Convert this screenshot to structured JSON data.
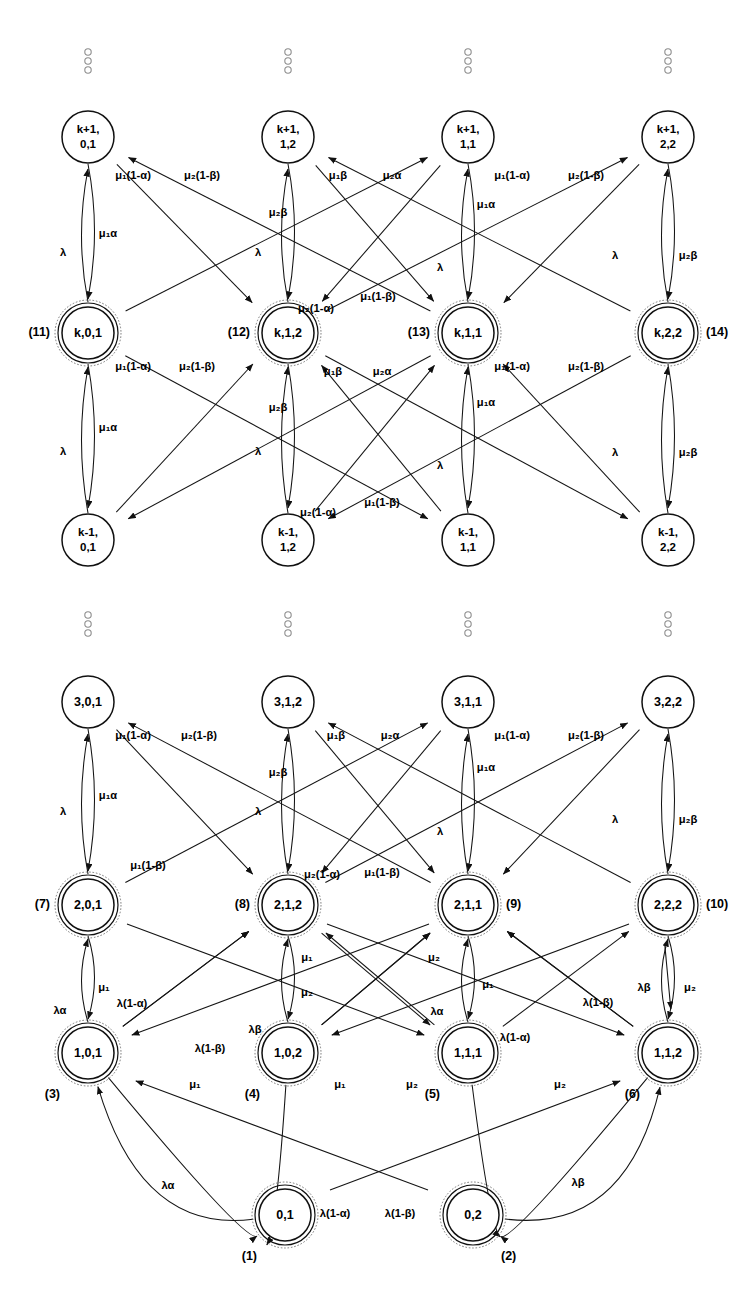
{
  "figure": {
    "type": "state-transition-diagram",
    "symbols": {
      "lambda": "λ",
      "mu": "μ",
      "alpha": "α",
      "beta": "β"
    }
  },
  "columns": [
    {
      "key": "c1",
      "x": 88,
      "tail": "0,1"
    },
    {
      "key": "c2",
      "x": 288,
      "tail": "1,2"
    },
    {
      "key": "c3",
      "x": 468,
      "tail": "1,1"
    },
    {
      "key": "c4",
      "x": 668,
      "tail": "2,2"
    }
  ],
  "vertical_dots": {
    "rows_y": [
      52,
      615
    ],
    "columns_x": [
      88,
      288,
      468,
      668
    ],
    "dot_count": 3,
    "dot_radius": 3.2,
    "dot_spacing": 9
  },
  "nodes": [
    {
      "id": "n_kp1_01",
      "line1": "k+1,",
      "line2": "0,1",
      "x": 88,
      "y": 137,
      "r": 26,
      "double": false,
      "index": ""
    },
    {
      "id": "n_kp1_12",
      "line1": "k+1,",
      "line2": "1,2",
      "x": 288,
      "y": 137,
      "r": 26,
      "double": false,
      "index": ""
    },
    {
      "id": "n_kp1_11",
      "line1": "k+1,",
      "line2": "1,1",
      "x": 468,
      "y": 137,
      "r": 26,
      "double": false,
      "index": ""
    },
    {
      "id": "n_kp1_22",
      "line1": "k+1,",
      "line2": "2,2",
      "x": 668,
      "y": 137,
      "r": 26,
      "double": false,
      "index": ""
    },
    {
      "id": "n_k_01",
      "line1": "k,0,1",
      "line2": "",
      "x": 88,
      "y": 333,
      "r": 26,
      "double": true,
      "index": "(11)",
      "index_side": "left"
    },
    {
      "id": "n_k_12",
      "line1": "k,1,2",
      "line2": "",
      "x": 288,
      "y": 333,
      "r": 26,
      "double": true,
      "index": "(12)",
      "index_side": "left"
    },
    {
      "id": "n_k_11",
      "line1": "k,1,1",
      "line2": "",
      "x": 468,
      "y": 333,
      "r": 26,
      "double": true,
      "index": "(13)",
      "index_side": "left"
    },
    {
      "id": "n_k_22",
      "line1": "k,2,2",
      "line2": "",
      "x": 668,
      "y": 333,
      "r": 26,
      "double": true,
      "index": "(14)",
      "index_side": "right"
    },
    {
      "id": "n_km1_01",
      "line1": "k-1,",
      "line2": "0,1",
      "x": 88,
      "y": 540,
      "r": 26,
      "double": false,
      "index": ""
    },
    {
      "id": "n_km1_12",
      "line1": "k-1,",
      "line2": "1,2",
      "x": 288,
      "y": 540,
      "r": 26,
      "double": false,
      "index": ""
    },
    {
      "id": "n_km1_11",
      "line1": "k-1,",
      "line2": "1,1",
      "x": 468,
      "y": 540,
      "r": 26,
      "double": false,
      "index": ""
    },
    {
      "id": "n_km1_22",
      "line1": "k-1,",
      "line2": "2,2",
      "x": 668,
      "y": 540,
      "r": 26,
      "double": false,
      "index": ""
    },
    {
      "id": "n_3_01",
      "line1": "3,0,1",
      "line2": "",
      "x": 88,
      "y": 702,
      "r": 26,
      "double": false,
      "index": ""
    },
    {
      "id": "n_3_12",
      "line1": "3,1,2",
      "line2": "",
      "x": 288,
      "y": 702,
      "r": 26,
      "double": false,
      "index": ""
    },
    {
      "id": "n_3_11",
      "line1": "3,1,1",
      "line2": "",
      "x": 468,
      "y": 702,
      "r": 26,
      "double": false,
      "index": ""
    },
    {
      "id": "n_3_22",
      "line1": "3,2,2",
      "line2": "",
      "x": 668,
      "y": 702,
      "r": 26,
      "double": false,
      "index": ""
    },
    {
      "id": "n_2_01",
      "line1": "2,0,1",
      "line2": "",
      "x": 88,
      "y": 905,
      "r": 26,
      "double": true,
      "index": "(7)",
      "index_side": "left"
    },
    {
      "id": "n_2_12",
      "line1": "2,1,2",
      "line2": "",
      "x": 288,
      "y": 905,
      "r": 26,
      "double": true,
      "index": "(8)",
      "index_side": "left"
    },
    {
      "id": "n_2_11",
      "line1": "2,1,1",
      "line2": "",
      "x": 468,
      "y": 905,
      "r": 26,
      "double": true,
      "index": "(9)",
      "index_side": "right"
    },
    {
      "id": "n_2_22",
      "line1": "2,2,2",
      "line2": "",
      "x": 668,
      "y": 905,
      "r": 26,
      "double": true,
      "index": "(10)",
      "index_side": "right"
    },
    {
      "id": "n_1_01",
      "line1": "1,0,1",
      "line2": "",
      "x": 88,
      "y": 1053,
      "r": 26,
      "double": true,
      "index": "(3)",
      "index_side": "below-left"
    },
    {
      "id": "n_1_02",
      "line1": "1,0,2",
      "line2": "",
      "x": 288,
      "y": 1053,
      "r": 26,
      "double": true,
      "index": "(4)",
      "index_side": "below-left"
    },
    {
      "id": "n_1_11",
      "line1": "1,1,1",
      "line2": "",
      "x": 468,
      "y": 1053,
      "r": 26,
      "double": true,
      "index": "(5)",
      "index_side": "below-left"
    },
    {
      "id": "n_1_12",
      "line1": "1,1,2",
      "line2": "",
      "x": 668,
      "y": 1053,
      "r": 26,
      "double": true,
      "index": "(6)",
      "index_side": "below-left"
    },
    {
      "id": "n_0_1",
      "line1": "0,1",
      "line2": "",
      "x": 285,
      "y": 1215,
      "r": 26,
      "double": true,
      "index": "(1)",
      "index_side": "below-left"
    },
    {
      "id": "n_0_2",
      "line1": "0,2",
      "line2": "",
      "x": 473,
      "y": 1215,
      "r": 26,
      "double": true,
      "index": "(2)",
      "index_side": "below-right"
    }
  ],
  "edge_labels_upper": [
    {
      "text": "μ₁(1-α)",
      "x": 133,
      "y": 176
    },
    {
      "text": "μ₂(1-β)",
      "x": 202,
      "y": 176
    },
    {
      "text": "μ₁β",
      "x": 338,
      "y": 176
    },
    {
      "text": "μ₂α",
      "x": 392,
      "y": 176
    },
    {
      "text": "μ₁(1-α)",
      "x": 512,
      "y": 176
    },
    {
      "text": "μ₂(1-β)",
      "x": 586,
      "y": 176
    },
    {
      "text": "μ₂β",
      "x": 278,
      "y": 213
    },
    {
      "text": "λ",
      "x": 63,
      "y": 253
    },
    {
      "text": "μ₁α",
      "x": 108,
      "y": 234
    },
    {
      "text": "λ",
      "x": 258,
      "y": 253
    },
    {
      "text": "λ",
      "x": 440,
      "y": 268
    },
    {
      "text": "μ₁α",
      "x": 486,
      "y": 205
    },
    {
      "text": "λ",
      "x": 615,
      "y": 256
    },
    {
      "text": "μ₂β",
      "x": 688,
      "y": 256
    },
    {
      "text": "μ₂(1-α)",
      "x": 316,
      "y": 309
    },
    {
      "text": "μ₁(1-β)",
      "x": 378,
      "y": 297
    },
    {
      "text": "μ₁(1-α)",
      "x": 133,
      "y": 367
    },
    {
      "text": "μ₂(1-β)",
      "x": 197,
      "y": 367
    },
    {
      "text": "μ₁β",
      "x": 333,
      "y": 372
    },
    {
      "text": "μ₂α",
      "x": 382,
      "y": 372
    },
    {
      "text": "μ₁(1-α)",
      "x": 512,
      "y": 367
    },
    {
      "text": "μ₂(1-β)",
      "x": 586,
      "y": 367
    },
    {
      "text": "μ₂β",
      "x": 278,
      "y": 408
    },
    {
      "text": "λ",
      "x": 63,
      "y": 452
    },
    {
      "text": "μ₁α",
      "x": 108,
      "y": 428
    },
    {
      "text": "λ",
      "x": 258,
      "y": 452
    },
    {
      "text": "λ",
      "x": 440,
      "y": 466
    },
    {
      "text": "μ₁α",
      "x": 486,
      "y": 403
    },
    {
      "text": "λ",
      "x": 615,
      "y": 453
    },
    {
      "text": "μ₂β",
      "x": 688,
      "y": 453
    },
    {
      "text": "μ₂(1-α)",
      "x": 318,
      "y": 513
    },
    {
      "text": "μ₁(1-β)",
      "x": 382,
      "y": 503
    }
  ],
  "edge_labels_lower": [
    {
      "text": "μ₁(1-α)",
      "x": 133,
      "y": 736
    },
    {
      "text": "μ₂(1-β)",
      "x": 199,
      "y": 736
    },
    {
      "text": "μ₁β",
      "x": 336,
      "y": 736
    },
    {
      "text": "μ₂α",
      "x": 390,
      "y": 736
    },
    {
      "text": "μ₁(1-α)",
      "x": 512,
      "y": 736
    },
    {
      "text": "μ₂(1-β)",
      "x": 586,
      "y": 736
    },
    {
      "text": "μ₂β",
      "x": 278,
      "y": 773
    },
    {
      "text": "λ",
      "x": 63,
      "y": 812
    },
    {
      "text": "μ₁α",
      "x": 108,
      "y": 796
    },
    {
      "text": "λ",
      "x": 258,
      "y": 812
    },
    {
      "text": "λ",
      "x": 440,
      "y": 832
    },
    {
      "text": "μ₁α",
      "x": 486,
      "y": 768
    },
    {
      "text": "λ",
      "x": 615,
      "y": 820
    },
    {
      "text": "μ₂β",
      "x": 688,
      "y": 820
    },
    {
      "text": "μ₁(1-β)",
      "x": 148,
      "y": 866
    },
    {
      "text": "μ₂(1-α)",
      "x": 322,
      "y": 875
    },
    {
      "text": "μ₁(1-β)",
      "x": 382,
      "y": 873
    },
    {
      "text": "μ₁",
      "x": 104,
      "y": 988
    },
    {
      "text": "λα",
      "x": 60,
      "y": 1011
    },
    {
      "text": "λ(1-α)",
      "x": 132,
      "y": 1004
    },
    {
      "text": "μ₁",
      "x": 307,
      "y": 958
    },
    {
      "text": "μ₂",
      "x": 307,
      "y": 993
    },
    {
      "text": "λβ",
      "x": 255,
      "y": 1030
    },
    {
      "text": "λ(1-β)",
      "x": 210,
      "y": 1049
    },
    {
      "text": "μ₂",
      "x": 434,
      "y": 958
    },
    {
      "text": "μ₁",
      "x": 488,
      "y": 985
    },
    {
      "text": "λα",
      "x": 437,
      "y": 1012
    },
    {
      "text": "λ(1-α)",
      "x": 515,
      "y": 1038
    },
    {
      "text": "λ(1-β)",
      "x": 598,
      "y": 1003
    },
    {
      "text": "λβ",
      "x": 644,
      "y": 988
    },
    {
      "text": "μ₂",
      "x": 690,
      "y": 988
    },
    {
      "text": "μ₁",
      "x": 195,
      "y": 1085
    },
    {
      "text": "μ₁",
      "x": 340,
      "y": 1085
    },
    {
      "text": "μ₂",
      "x": 412,
      "y": 1085
    },
    {
      "text": "μ₂",
      "x": 560,
      "y": 1085
    },
    {
      "text": "λα",
      "x": 168,
      "y": 1186
    },
    {
      "text": "λ(1-α)",
      "x": 335,
      "y": 1214
    },
    {
      "text": "λ(1-β)",
      "x": 400,
      "y": 1214
    },
    {
      "text": "λβ",
      "x": 578,
      "y": 1183
    }
  ]
}
